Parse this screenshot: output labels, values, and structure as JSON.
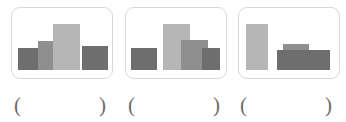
{
  "page": {
    "kind": "multiple-choice-bar-chart-question",
    "background_color": "#ffffff",
    "card_border_color": "#d8d8d8",
    "blank_paren_open": "(",
    "blank_paren_close": ")"
  },
  "palette": {
    "light_gray": "#b6b6b6",
    "mid_gray": "#8f8f8f",
    "dark_gray": "#6e6e6e",
    "card_border": "#d8d8d8",
    "paren_color": "#6b6b6b"
  },
  "options": [
    {
      "id": "option-a",
      "label": "",
      "blank_open": "(",
      "blank_close": ")",
      "chart_data": {
        "type": "bar",
        "title": "",
        "subtitle": "",
        "xlabel": "",
        "ylabel": "",
        "grid": false,
        "legend": false,
        "categories": [
          "1",
          "2",
          "3",
          "4"
        ],
        "values": [
          38,
          50,
          80,
          42
        ],
        "ylim": [
          0,
          100
        ],
        "bars": [
          {
            "name": "bar-1",
            "x": 6,
            "width": 26,
            "height": 38,
            "color": "#6e6e6e"
          },
          {
            "name": "bar-2",
            "x": 26,
            "width": 20,
            "height": 50,
            "color": "#8f8f8f"
          },
          {
            "name": "bar-3",
            "x": 41,
            "width": 27,
            "height": 80,
            "color": "#b6b6b6"
          },
          {
            "name": "bar-4",
            "x": 70,
            "width": 26,
            "height": 42,
            "color": "#6e6e6e"
          }
        ]
      }
    },
    {
      "id": "option-b",
      "label": "",
      "blank_open": "(",
      "blank_close": ")",
      "chart_data": {
        "type": "bar",
        "title": "",
        "subtitle": "",
        "xlabel": "",
        "ylabel": "",
        "grid": false,
        "legend": false,
        "categories": [
          "1",
          "2",
          "3",
          "4"
        ],
        "values": [
          38,
          80,
          52,
          38
        ],
        "ylim": [
          0,
          100
        ],
        "bars": [
          {
            "name": "bar-1",
            "x": 5,
            "width": 26,
            "height": 38,
            "color": "#6e6e6e"
          },
          {
            "name": "bar-2",
            "x": 37,
            "width": 27,
            "height": 80,
            "color": "#b6b6b6"
          },
          {
            "name": "bar-3",
            "x": 55,
            "width": 27,
            "height": 52,
            "color": "#8f8f8f"
          },
          {
            "name": "bar-4",
            "x": 76,
            "width": 18,
            "height": 38,
            "color": "#6e6e6e"
          }
        ]
      }
    },
    {
      "id": "option-c",
      "label": "",
      "blank_open": "(",
      "blank_close": ")",
      "chart_data": {
        "type": "bar",
        "title": "",
        "subtitle": "",
        "xlabel": "",
        "ylabel": "",
        "grid": false,
        "legend": false,
        "categories": [
          "1",
          "2",
          "3"
        ],
        "values": [
          80,
          44,
          34
        ],
        "ylim": [
          0,
          100
        ],
        "bars": [
          {
            "name": "bar-1",
            "x": 7,
            "width": 22,
            "height": 80,
            "color": "#b6b6b6"
          },
          {
            "name": "bar-2",
            "x": 44,
            "width": 26,
            "height": 44,
            "color": "#8f8f8f"
          },
          {
            "name": "bar-3",
            "x": 38,
            "width": 53,
            "height": 34,
            "color": "#6e6e6e"
          }
        ]
      }
    }
  ]
}
